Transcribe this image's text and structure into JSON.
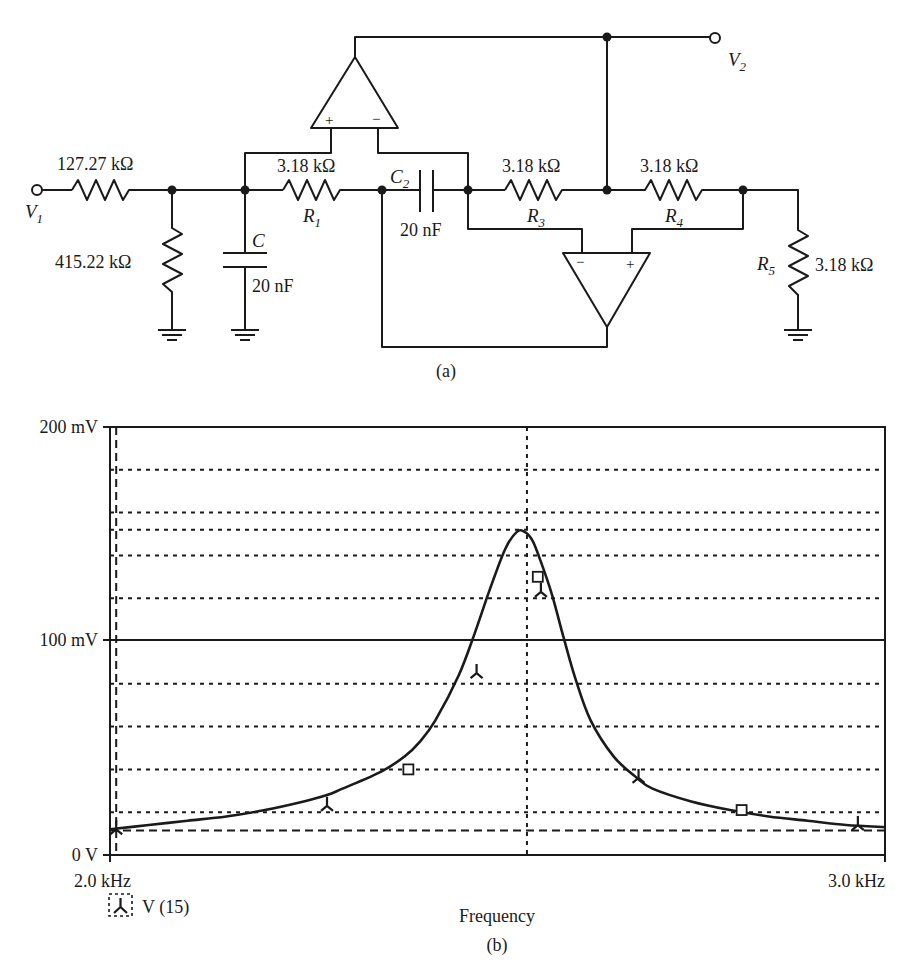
{
  "circuit": {
    "caption": "(a)",
    "input_label": "V",
    "input_sub": "1",
    "output_label": "V",
    "output_sub": "2",
    "components": {
      "r_in": {
        "value": "127.27 kΩ"
      },
      "r_shunt": {
        "value": "415.22 kΩ"
      },
      "c": {
        "name": "C",
        "value": "20 nF"
      },
      "r1": {
        "name": "R",
        "sub": "1",
        "value": "3.18 kΩ"
      },
      "c2": {
        "name": "C",
        "sub": "2",
        "value": "20 nF"
      },
      "r3": {
        "name": "R",
        "sub": "3",
        "value": "3.18 kΩ"
      },
      "r4": {
        "name": "R",
        "sub": "4",
        "value": "3.18 kΩ"
      },
      "r5": {
        "name": "R",
        "sub": "5",
        "value": "3.18 kΩ"
      }
    },
    "opamp_top": {
      "plus": "+",
      "minus": "−"
    },
    "opamp_bottom": {
      "plus": "+",
      "minus": "−"
    }
  },
  "chart": {
    "caption": "(b)"
  },
  "chart_data": {
    "type": "line",
    "title": "",
    "xlabel": "Frequency",
    "ylabel": "",
    "x_unit": "kHz",
    "y_unit": "mV",
    "xlim": [
      2.0,
      3.0
    ],
    "ylim": [
      0,
      200
    ],
    "x_tick_labels": [
      "2.0 kHz",
      "3.0 kHz"
    ],
    "y_tick_labels": [
      "0 V",
      "100 mV",
      "200 mV"
    ],
    "y_ticks": [
      0,
      100,
      200
    ],
    "grid": true,
    "h_dotted_gridlines_mV": [
      20,
      40,
      60,
      80,
      120,
      140,
      152,
      160,
      180
    ],
    "h_dashed_gridline_mV": 11.5,
    "v_dashed_gridline_kHz": 2.008,
    "v_dotted_gridline_kHz": 2.538,
    "legend": [
      {
        "marker": "tri-marker",
        "label": "V (15)"
      }
    ],
    "legend_position": "bottom-left",
    "series": [
      {
        "name": "V (15)",
        "x": [
          2.0,
          2.05,
          2.1,
          2.15,
          2.2,
          2.25,
          2.28,
          2.3,
          2.35,
          2.38,
          2.4,
          2.42,
          2.45,
          2.47,
          2.49,
          2.51,
          2.525,
          2.535,
          2.545,
          2.555,
          2.57,
          2.585,
          2.6,
          2.62,
          2.65,
          2.68,
          2.7,
          2.75,
          2.8,
          2.85,
          2.9,
          2.95,
          3.0
        ],
        "y": [
          12,
          14,
          16,
          18,
          21,
          25,
          28,
          31,
          39,
          46,
          53,
          63,
          84,
          103,
          124,
          143,
          151,
          151,
          147,
          138,
          122,
          102,
          83,
          63,
          46,
          36,
          31,
          25,
          21,
          18,
          16,
          14,
          13
        ]
      }
    ],
    "markers": [
      {
        "type": "tri",
        "x": 2.008,
        "y": 12
      },
      {
        "type": "tri",
        "x": 2.28,
        "y": 23
      },
      {
        "type": "square",
        "x": 2.385,
        "y": 40
      },
      {
        "type": "tri",
        "x": 2.473,
        "y": 85
      },
      {
        "type": "square",
        "x": 2.552,
        "y": 130
      },
      {
        "type": "tri",
        "x": 2.556,
        "y": 123
      },
      {
        "type": "tri",
        "x": 2.682,
        "y": 36
      },
      {
        "type": "square",
        "x": 2.815,
        "y": 21
      },
      {
        "type": "tri",
        "x": 2.965,
        "y": 14
      }
    ],
    "annotations": [
      "(b)"
    ]
  }
}
